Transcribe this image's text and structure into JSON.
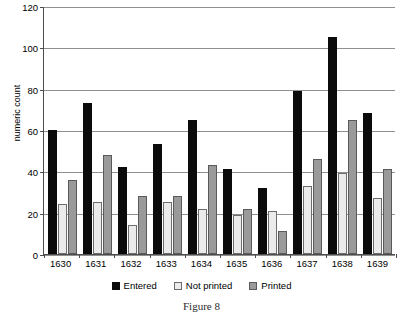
{
  "caption": "Figure 8",
  "chart_data": {
    "type": "bar",
    "title": "",
    "xlabel": "",
    "ylabel": "numeric count",
    "ylim": [
      0,
      120
    ],
    "yticks": [
      0,
      20,
      40,
      60,
      80,
      100,
      120
    ],
    "ytick_labels": [
      "0",
      "20",
      "40",
      "60",
      "80",
      "100",
      "120"
    ],
    "grid": true,
    "legend_position": "bottom",
    "categories": [
      "1630",
      "1631",
      "1632",
      "1633",
      "1634",
      "1635",
      "1636",
      "1637",
      "1638",
      "1639"
    ],
    "series": [
      {
        "name": "Entered",
        "color": "#0b0b0b",
        "values": [
          60,
          73,
          42,
          53,
          65,
          41,
          32,
          79,
          105,
          68
        ]
      },
      {
        "name": "Not printed",
        "color": "#ebebeb",
        "values": [
          24,
          25,
          14,
          25,
          22,
          19,
          21,
          33,
          39,
          27
        ]
      },
      {
        "name": "Printed",
        "color": "#9a9a9a",
        "values": [
          36,
          48,
          28,
          28,
          43,
          22,
          11,
          46,
          65,
          41
        ]
      }
    ]
  }
}
